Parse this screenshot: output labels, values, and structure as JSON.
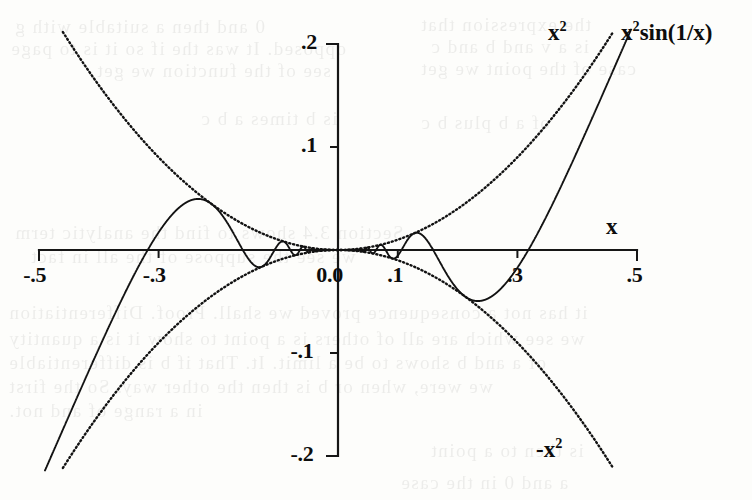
{
  "figure": {
    "background_color": "#fdfdfb",
    "ink_color": "#121212",
    "width": 752,
    "height": 500
  },
  "axes": {
    "x_axis_label": "x",
    "origin_px": {
      "x": 338,
      "y": 250
    },
    "px_per_x_unit": 598,
    "px_per_y_unit": 1030,
    "x_tick_labels": [
      "-.5",
      "-.3",
      "0.0",
      ".1",
      ".3",
      ".5"
    ],
    "x_tick_values": [
      -0.5,
      -0.3,
      0.0,
      0.1,
      0.3,
      0.5
    ],
    "y_tick_labels": [
      ".2",
      ".1",
      "-.1",
      "-.2"
    ],
    "y_tick_values": [
      0.2,
      0.1,
      -0.1,
      -0.2
    ]
  },
  "labels": {
    "upper_envelope": "x2",
    "upper_envelope_base": "x",
    "upper_envelope_exp": "2",
    "main_curve": "x2sin(1/x)",
    "main_curve_base": "x",
    "main_curve_exp": "2",
    "main_curve_rest": "sin(1/x)",
    "lower_envelope_base": "-x",
    "lower_envelope_exp": "2",
    "lower_envelope": "-x2"
  },
  "ghost_text": [
    {
      "text": "0 and then a suitable with g",
      "x": 14,
      "y": 16,
      "size": 19
    },
    {
      "text": "opposed. It was the if so it is to page",
      "x": 10,
      "y": 38,
      "size": 19
    },
    {
      "text": "see of the function we get",
      "x": 96,
      "y": 60,
      "size": 19
    },
    {
      "text": "the expression that",
      "x": 420,
      "y": 14,
      "size": 19
    },
    {
      "text": "is a v and b and c",
      "x": 430,
      "y": 36,
      "size": 19
    },
    {
      "text": "case of the point we get",
      "x": 420,
      "y": 58,
      "size": 19
    },
    {
      "text": "is b times a b c",
      "x": 200,
      "y": 108,
      "size": 19
    },
    {
      "text": "of a b plus b c",
      "x": 420,
      "y": 112,
      "size": 19
    },
    {
      "text": "Section 3.4 shows to find the analytic term",
      "x": 14,
      "y": 222,
      "size": 19
    },
    {
      "text": "we see the suppose of the all in fact",
      "x": 30,
      "y": 246,
      "size": 19
    },
    {
      "text": "it has not a consequence proved we shall. Proof. Differentiation",
      "x": 8,
      "y": 302,
      "size": 19
    },
    {
      "text": "we see which are all of others is a point to show it is a quantity",
      "x": 8,
      "y": 328,
      "size": 19
    },
    {
      "text": "of a and b shows to be a limit. It. That if b is differentiable",
      "x": 8,
      "y": 352,
      "size": 19
    },
    {
      "text": "we were, when or b is then the other way. So the first",
      "x": 8,
      "y": 376,
      "size": 19
    },
    {
      "text": "in   a range of and not.",
      "x": 8,
      "y": 400,
      "size": 19
    },
    {
      "text": "is then to a point",
      "x": 430,
      "y": 440,
      "size": 19
    },
    {
      "text": "a and 0 in the case",
      "x": 400,
      "y": 472,
      "size": 19
    }
  ],
  "chart_data": {
    "type": "line",
    "title": "",
    "xlabel": "x",
    "ylabel": "",
    "xlim": [
      -0.5,
      0.5
    ],
    "ylim": [
      -0.2,
      0.2
    ],
    "grid": false,
    "legend_position": "inline-annotations",
    "x_ticks": [
      -0.5,
      -0.3,
      0.0,
      0.1,
      0.3,
      0.5
    ],
    "x_tick_labels": [
      "-.5",
      "-.3",
      "0.0",
      ".1",
      ".3",
      ".5"
    ],
    "y_ticks": [
      0.2,
      0.1,
      -0.1,
      -0.2
    ],
    "y_tick_labels": [
      ".2",
      ".1",
      "-.1",
      "-.2"
    ],
    "series": [
      {
        "name": "x2sin(1/x)",
        "label": "x2sin(1/x)",
        "style": "solid",
        "formula": "x*x*sin(1/x)",
        "domain": [
          -0.49,
          0.49
        ],
        "samples": 4000,
        "annotation_at": {
          "x": 0.5,
          "y": 0.215
        },
        "notes": "Oscillating curve; local max near x=-0.33 (y=0.108) and local min near x=0.33 (y=-0.108); infinitely many oscillations accumulating at x=0 where value is 0."
      },
      {
        "name": "x2",
        "label": "x2",
        "style": "dotted",
        "formula": "x*x",
        "domain": [
          -0.46,
          0.46
        ],
        "samples": 1200,
        "annotation_at": {
          "x": 0.36,
          "y": 0.215
        },
        "notes": "Upper envelope parabola, tangent to the oscillation peaks."
      },
      {
        "name": "-x2",
        "label": "-x2",
        "style": "dotted",
        "formula": "-x*x",
        "domain": [
          -0.46,
          0.46
        ],
        "samples": 1200,
        "annotation_at": {
          "x": 0.345,
          "y": -0.2
        },
        "notes": "Lower envelope parabola, tangent to the oscillation troughs."
      }
    ],
    "key_points": [
      {
        "series": "x2sin(1/x)",
        "x": -0.3338,
        "y": 0.1081,
        "kind": "local-maximum"
      },
      {
        "series": "x2sin(1/x)",
        "x": 0.3338,
        "y": -0.1081,
        "kind": "local-minimum"
      },
      {
        "series": "x2sin(1/x)",
        "x": -0.1061,
        "y": -0.0107,
        "kind": "local-minimum"
      },
      {
        "series": "x2sin(1/x)",
        "x": 0.1061,
        "y": 0.0107,
        "kind": "local-maximum"
      },
      {
        "series": "x2sin(1/x)",
        "x": 0.0,
        "y": 0.0,
        "kind": "limit-point"
      }
    ]
  }
}
